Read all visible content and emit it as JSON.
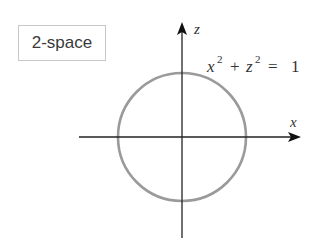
{
  "diagram": {
    "label": "2-space",
    "axes": {
      "horizontal_label": "x",
      "vertical_label": "z"
    },
    "equation": {
      "var1": "x",
      "exp1": "2",
      "plus": "+",
      "var2": "z",
      "exp2": "2",
      "equals": "=",
      "rhs": "1"
    },
    "shape": "circle",
    "colors": {
      "axis": "#222222",
      "circle": "#9a9a9a",
      "label_border": "#c8c8c8",
      "text": "#333333"
    }
  }
}
